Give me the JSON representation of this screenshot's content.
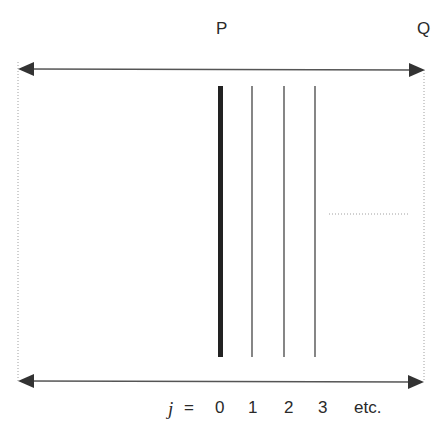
{
  "labels": {
    "P": "P",
    "Q": "Q"
  },
  "index_row": {
    "variable": "j",
    "equals": "=",
    "values": [
      "0",
      "1",
      "2",
      "3"
    ],
    "suffix": "etc."
  },
  "colors": {
    "line": "#3a3a3a",
    "thick_line": "#222222",
    "dotted": "#9a9a9a"
  }
}
